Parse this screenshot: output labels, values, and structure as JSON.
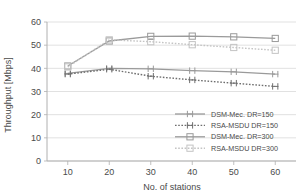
{
  "chart_data": {
    "type": "line",
    "title": "",
    "xlabel": "No. of stations",
    "ylabel": "Throughput [Mbps]",
    "x": [
      10,
      20,
      30,
      40,
      50,
      60
    ],
    "xlim": [
      5,
      65
    ],
    "ylim": [
      0,
      60
    ],
    "xticks": [
      "10",
      "20",
      "30",
      "40",
      "50",
      "60"
    ],
    "yticks": [
      "0",
      "10",
      "20",
      "30",
      "40",
      "50",
      "60"
    ],
    "grid": true,
    "legend_position": "lower right",
    "series": [
      {
        "name": "DSM-Mec. DR=150",
        "values": [
          37.8,
          40.0,
          39.8,
          39.0,
          38.5,
          37.5
        ],
        "color": "#9a9a9a",
        "dash": "none",
        "marker": "ibeam"
      },
      {
        "name": "RSA-MSDU DR=150",
        "values": [
          37.5,
          39.6,
          36.6,
          35.0,
          33.6,
          32.2
        ],
        "color": "#6e6e6e",
        "dash": "dotted",
        "marker": "ibeam"
      },
      {
        "name": "DSM-Mec. DR=300",
        "values": [
          41.0,
          51.8,
          53.8,
          53.9,
          53.6,
          52.9
        ],
        "color": "#9a9a9a",
        "dash": "none",
        "marker": "square"
      },
      {
        "name": "RSA-MSDU DR=300",
        "values": [
          40.6,
          52.3,
          51.5,
          50.2,
          49.0,
          47.8
        ],
        "color": "#c4c4c4",
        "dash": "dotted",
        "marker": "square"
      }
    ]
  },
  "axes": {
    "x_title": "No. of stations",
    "y_title": "Throughput [Mbps]"
  },
  "legend": {
    "entries": [
      {
        "label": "DSM-Mec. DR=150"
      },
      {
        "label": "RSA-MSDU DR=150"
      },
      {
        "label": "DSM-Mec. DR=300"
      },
      {
        "label": "RSA-MSDU DR=300"
      }
    ]
  },
  "colors": {
    "axis": "#b0b0b0",
    "grid": "#d9d9d9",
    "text": "#4a4a4a",
    "series_dsm_150": "#9a9a9a",
    "series_rsa_150": "#6e6e6e",
    "series_dsm_300": "#9a9a9a",
    "series_rsa_300": "#c4c4c4"
  }
}
